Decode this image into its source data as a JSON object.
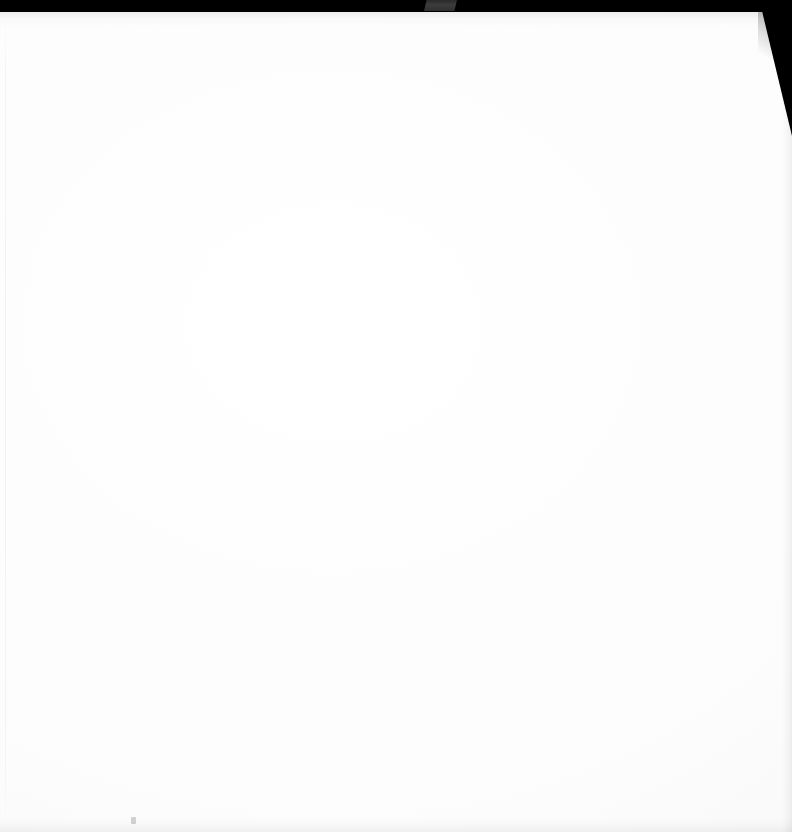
{
  "document": {
    "kind": "scanned-page",
    "page_label": "",
    "body_text": "",
    "is_blank": "true"
  },
  "scan": {
    "top_band_label": "scanner-black-border",
    "tab_label": "scanner-lid-tab",
    "corner_label": "scanner-corner-shadow",
    "speck_label": "scan-artifact-speck"
  },
  "colors": {
    "border_black": "#000000",
    "tab_gray": "#3c3c3c",
    "paper_white": "#ffffff",
    "paper_tone": "#f6f6f8"
  },
  "dimensions": {
    "width": "792",
    "height": "832"
  }
}
